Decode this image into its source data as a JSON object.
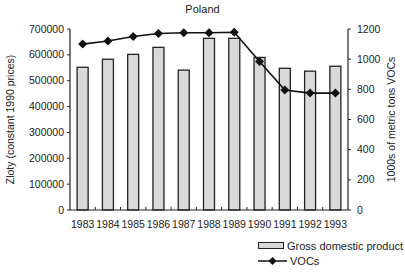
{
  "chart_data": {
    "type": "bar",
    "title": "Poland",
    "categories": [
      "1983",
      "1984",
      "1985",
      "1986",
      "1987",
      "1988",
      "1989",
      "1990",
      "1991",
      "1992",
      "1993"
    ],
    "series": [
      {
        "name": "Gross domestic product",
        "kind": "bar",
        "axis": "left",
        "values": [
          552000,
          583000,
          602000,
          629000,
          541000,
          664000,
          664000,
          590000,
          548000,
          537000,
          556000
        ]
      },
      {
        "name": "VOCs",
        "kind": "line",
        "axis": "right",
        "marker": "diamond",
        "values": [
          1100,
          1120,
          1150,
          1170,
          1175,
          1175,
          1178,
          985,
          795,
          775,
          775
        ]
      }
    ],
    "ylabel": "Zloty (constant 1990 prices)",
    "ylabel_right": "1000s of metric tons VOCs",
    "xlabel": "",
    "ylim": [
      0,
      700000
    ],
    "ylim_right": [
      0,
      1200
    ],
    "yticks": [
      0,
      100000,
      200000,
      300000,
      400000,
      500000,
      600000,
      700000
    ],
    "yticks_right": [
      0,
      200,
      400,
      600,
      800,
      1000,
      1200
    ],
    "grid": false,
    "legend_position": "bottom-right",
    "colors": {
      "bar_fill": "#d9d9d9",
      "bar_stroke": "#222222",
      "line": "#111111"
    }
  },
  "legend": {
    "items": [
      {
        "label": "Gross domestic product"
      },
      {
        "label": "VOCs"
      }
    ]
  }
}
